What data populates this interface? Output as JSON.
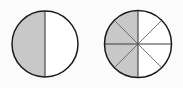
{
  "figure": {
    "type": "fraction-circles",
    "background_color": "#fbfbfb",
    "canvas": {
      "width": 183,
      "height": 88
    }
  },
  "style": {
    "shaded_fill": "#c8c8c8",
    "empty_fill": "#ffffff",
    "outline_color": "#1a1a1a",
    "outline_width": 1.5,
    "divider_color": "#555555",
    "divider_width": 0.8,
    "main_divider_color": "#3a3a3a",
    "main_divider_width": 1.1
  },
  "chart_data": {
    "type": "pie",
    "title": "",
    "xlabel": "",
    "ylabel": "",
    "legend": false,
    "grid": false,
    "charts": [
      {
        "name": "left-circle",
        "label": "one half shaded",
        "center_x": 45,
        "center_y": 44,
        "radius": 33,
        "total_parts": 2,
        "shaded_parts": 1,
        "fraction": "1/2",
        "value": 0.5,
        "sector_angle_degrees": 180,
        "start_angle_degrees": 90,
        "shaded_side": "left",
        "categories": [
          "shaded",
          "unshaded"
        ],
        "values": [
          1,
          1
        ],
        "sectors": [
          {
            "index": 0,
            "start": 90,
            "end": 270,
            "shaded": true
          },
          {
            "index": 1,
            "start": 270,
            "end": 450,
            "shaded": false
          }
        ],
        "dividers": [
          {
            "angle_degrees": 90,
            "kind": "vertical"
          }
        ]
      },
      {
        "name": "right-circle",
        "label": "four eighths shaded",
        "center_x": 138,
        "center_y": 44,
        "radius": 33.5,
        "total_parts": 8,
        "shaded_parts": 4,
        "fraction": "4/8",
        "value": 0.5,
        "sector_angle_degrees": 45,
        "start_angle_degrees": 90,
        "shaded_side": "left",
        "categories": [
          "shaded",
          "unshaded"
        ],
        "values": [
          4,
          4
        ],
        "sectors": [
          {
            "index": 0,
            "start": 90,
            "end": 135,
            "shaded": true
          },
          {
            "index": 1,
            "start": 135,
            "end": 180,
            "shaded": true
          },
          {
            "index": 2,
            "start": 180,
            "end": 225,
            "shaded": true
          },
          {
            "index": 3,
            "start": 225,
            "end": 270,
            "shaded": true
          },
          {
            "index": 4,
            "start": 270,
            "end": 315,
            "shaded": false
          },
          {
            "index": 5,
            "start": 315,
            "end": 360,
            "shaded": false
          },
          {
            "index": 6,
            "start": 0,
            "end": 45,
            "shaded": false
          },
          {
            "index": 7,
            "start": 45,
            "end": 90,
            "shaded": false
          }
        ],
        "dividers": [
          {
            "angle_degrees": 90,
            "kind": "vertical"
          },
          {
            "angle_degrees": 0,
            "kind": "horizontal"
          },
          {
            "angle_degrees": 45,
            "kind": "diagonal"
          },
          {
            "angle_degrees": 135,
            "kind": "diagonal"
          }
        ]
      }
    ]
  }
}
